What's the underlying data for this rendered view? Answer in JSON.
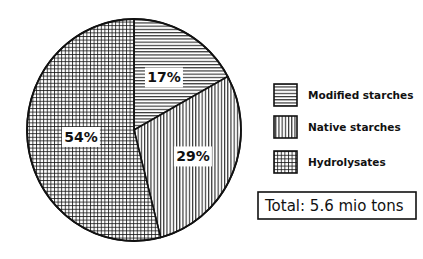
{
  "chart_data": {
    "type": "pie",
    "title": "",
    "slices": [
      {
        "name": "Modified starches",
        "value": 17,
        "label": "17%",
        "pattern": "horizontal"
      },
      {
        "name": "Native starches",
        "value": 29,
        "label": "29%",
        "pattern": "vertical"
      },
      {
        "name": "Hydrolysates",
        "value": 54,
        "label": "54%",
        "pattern": "grid"
      }
    ],
    "legend": {
      "placement": "right",
      "entries": [
        "Modified starches",
        "Native starches",
        "Hydrolysates"
      ]
    },
    "annotation": "Total: 5.6 mio tons",
    "start_angle_deg": 0,
    "direction": "clockwise"
  },
  "colors": {
    "ink": "#111111",
    "background": "#ffffff"
  }
}
